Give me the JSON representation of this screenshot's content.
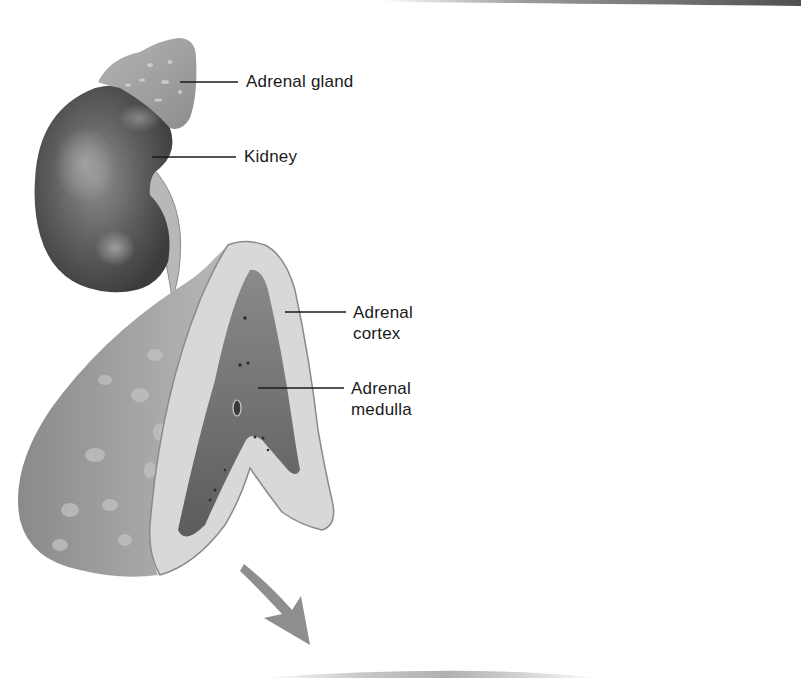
{
  "figure": {
    "type": "anatomical-illustration",
    "colors": {
      "background": "#ffffff",
      "label_text": "#1a1a1a",
      "leader_line": "#1a1a1a",
      "kidney_dark": "#4a4a4a",
      "kidney_light": "#9a9a9a",
      "adrenal_surface": "#a8a8a8",
      "cortex": "#d6d6d6",
      "medulla": "#707070",
      "arrow": "#8c8c8c",
      "top_band": "#5a5a5a"
    }
  },
  "labels": {
    "adrenal_gland": "Adrenal gland",
    "kidney": "Kidney",
    "adrenal_cortex": {
      "line1": "Adrenal",
      "line2": "cortex"
    },
    "adrenal_medulla": {
      "line1": "Adrenal",
      "line2": "medulla"
    }
  },
  "leaders": [
    {
      "name": "adrenal-gland",
      "x1": 180,
      "y1": 82,
      "x2": 238,
      "y2": 82
    },
    {
      "name": "kidney",
      "x1": 152,
      "y1": 157,
      "x2": 236,
      "y2": 157
    },
    {
      "name": "adrenal-cortex",
      "x1": 285,
      "y1": 312,
      "x2": 346,
      "y2": 312
    },
    {
      "name": "adrenal-medulla",
      "x1": 258,
      "y1": 388,
      "x2": 344,
      "y2": 388
    }
  ]
}
